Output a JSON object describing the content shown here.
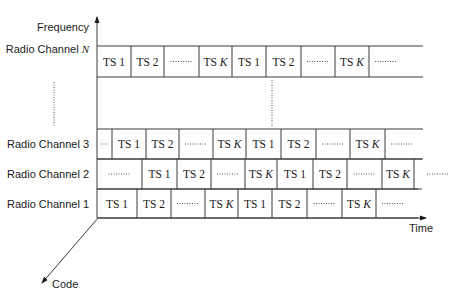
{
  "axes": {
    "frequency_label": "Frequency",
    "time_label": "Time",
    "code_label": "Code"
  },
  "colors": {
    "line": "#3a3a3a",
    "text": "#1a1a1a",
    "background": "#ffffff"
  },
  "rows": [
    {
      "label": "Radio Channel ",
      "label_italic": "N",
      "top": 46,
      "bottom": 77,
      "end": 423,
      "dividers": [
        131,
        164,
        199,
        232,
        266,
        301,
        335,
        369
      ],
      "cells": [
        "TS 1",
        "TS 2",
        "dots",
        "TS K",
        "TS 1",
        "TS 2",
        "dots",
        "TS K",
        "dots"
      ]
    },
    {
      "label": "Radio Channel 3",
      "label_italic": "",
      "top": 129,
      "bottom": 159,
      "end": 423,
      "dividers": [
        112,
        146,
        179,
        213,
        246,
        281,
        316,
        350,
        385
      ],
      "cells": [
        "dots",
        "TS 1",
        "TS 2",
        "dots",
        "TS K",
        "TS 1",
        "TS 2",
        "dots",
        "TS K",
        "dots"
      ]
    },
    {
      "label": "Radio Channel 2",
      "label_italic": "",
      "top": 159,
      "bottom": 189,
      "end": 422,
      "dividers": [
        142,
        177,
        211,
        245,
        277,
        313,
        347,
        382,
        414
      ],
      "cells": [
        "dots",
        "TS 1",
        "TS 2",
        "dots",
        "TS K",
        "TS 1",
        "TS 2",
        "dots",
        "TS K",
        "dots"
      ]
    },
    {
      "label": "Radio Channel 1",
      "label_italic": "",
      "top": 189,
      "bottom": 218,
      "end": 418,
      "dividers": [
        137,
        171,
        205,
        238,
        272,
        307,
        342,
        376
      ],
      "cells": [
        "TS 1",
        "TS 2",
        "dots",
        "TS K",
        "TS 1",
        "TS 2",
        "dots",
        "TS K",
        "dots"
      ]
    }
  ],
  "ellipsis": {
    "left": {
      "x": 54,
      "y1": 82,
      "y2": 127
    },
    "middle": {
      "x": 272,
      "y1": 80,
      "y2": 126
    }
  }
}
